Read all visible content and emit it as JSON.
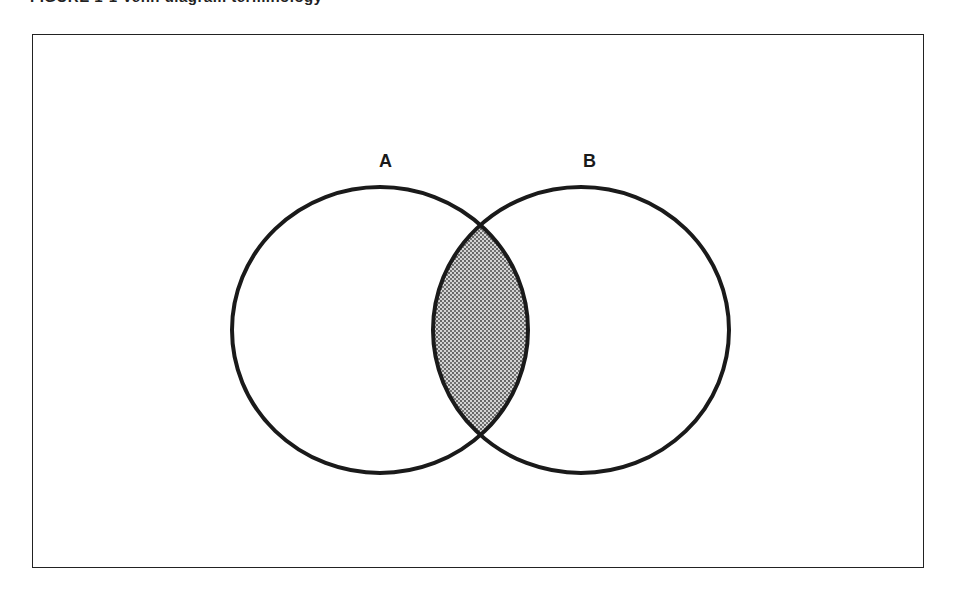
{
  "caption": {
    "text": "FIGURE 1-1  Venn diagram terminology"
  },
  "diagram": {
    "type": "venn",
    "sets": [
      {
        "label": "A",
        "cx": 380,
        "cy": 330,
        "rx": 148,
        "ry": 143
      },
      {
        "label": "B",
        "cx": 581,
        "cy": 330,
        "rx": 148,
        "ry": 143
      }
    ],
    "intersection": {
      "label": "A ∩ B",
      "shaded": true,
      "fill_color": "#b8b8b8",
      "dot_color": "#333333"
    },
    "stroke_color": "#1a1a1a",
    "stroke_width": 4
  },
  "labels": {
    "a": "A",
    "b": "B"
  }
}
